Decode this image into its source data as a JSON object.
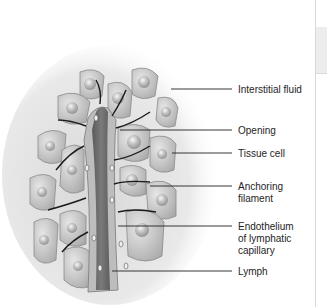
{
  "figure": {
    "labels": [
      {
        "id": "interstitial-fluid",
        "lines": [
          "Interstitial fluid"
        ],
        "y": 84,
        "line_y": 89,
        "line_x_start": 171
      },
      {
        "id": "opening",
        "lines": [
          "Opening"
        ],
        "y": 125,
        "line_y": 130,
        "line_x_start": 120
      },
      {
        "id": "tissue-cell",
        "lines": [
          "Tissue cell"
        ],
        "y": 148,
        "line_y": 153,
        "line_x_start": 172
      },
      {
        "id": "anchoring-filament",
        "lines": [
          "Anchoring",
          "filament"
        ],
        "y": 181,
        "line_y": 186,
        "line_x_start": 150
      },
      {
        "id": "endothelium",
        "lines": [
          "Endothelium",
          "of lymphatic",
          "capillary"
        ],
        "y": 221,
        "line_y": 226,
        "line_x_start": 118
      },
      {
        "id": "lymph",
        "lines": [
          "Lymph"
        ],
        "y": 266,
        "line_y": 271,
        "line_x_start": 112
      }
    ],
    "line_x_end": 232
  },
  "colors": {
    "cell_fill": "#c9c9c9",
    "cell_stroke": "#8a8a8a",
    "vessel_fill": "#6e6e6e",
    "vessel_wall": "#b5b5b5",
    "filament": "#1a1a1a",
    "halo": "#e8e8e8",
    "text": "#1e1e1e"
  }
}
